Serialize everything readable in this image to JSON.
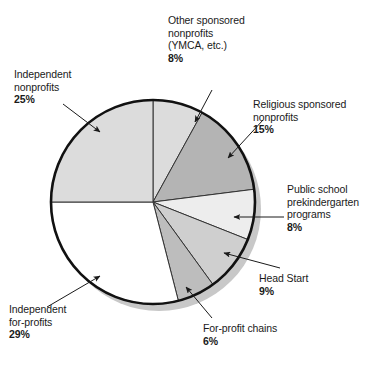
{
  "chart_data": {
    "type": "pie",
    "title": "",
    "subtitle": "",
    "xlabel": "",
    "ylabel": "",
    "legend_position": "callout-labels",
    "grid": false,
    "units": "percent",
    "start_angle_deg": 0,
    "direction": "clockwise",
    "center": {
      "x": 153,
      "y": 202
    },
    "radius": 102,
    "categories": [
      "Other sponsored nonprofits (YMCA, etc.)",
      "Religious sponsored nonprofits",
      "Public school prekindergarten programs",
      "Head Start",
      "For-profit chains",
      "Independent for-profits",
      "Independent nonprofits"
    ],
    "values": [
      8,
      15,
      8,
      9,
      6,
      29,
      25
    ],
    "slices": [
      {
        "name": "other-sponsored-nonprofits",
        "label_lines": [
          "Other sponsored",
          "nonprofits",
          "(YMCA, etc.)"
        ],
        "value": 8,
        "percent_text": "8%",
        "color": "#dcdcdc",
        "start_deg": 0,
        "end_deg": 28.8
      },
      {
        "name": "religious-sponsored-nonprofits",
        "label_lines": [
          "Religious sponsored",
          "nonprofits"
        ],
        "value": 15,
        "percent_text": "15%",
        "color": "#b4b4b4",
        "start_deg": 28.8,
        "end_deg": 82.8
      },
      {
        "name": "public-school-prekindergarten-programs",
        "label_lines": [
          "Public school",
          "prekindergarten",
          "programs"
        ],
        "value": 8,
        "percent_text": "8%",
        "color": "#ededed",
        "start_deg": 82.8,
        "end_deg": 111.6
      },
      {
        "name": "head-start",
        "label_lines": [
          "Head Start"
        ],
        "value": 9,
        "percent_text": "9%",
        "color": "#cfcfcf",
        "start_deg": 111.6,
        "end_deg": 144.0
      },
      {
        "name": "for-profit-chains",
        "label_lines": [
          "For-profit chains"
        ],
        "value": 6,
        "percent_text": "6%",
        "color": "#bdbdbd",
        "start_deg": 144.0,
        "end_deg": 165.6
      },
      {
        "name": "independent-for-profits",
        "label_lines": [
          "Independent",
          "for-profits"
        ],
        "value": 29,
        "percent_text": "29%",
        "color": "#ffffff",
        "start_deg": 165.6,
        "end_deg": 270.0
      },
      {
        "name": "independent-nonprofits",
        "label_lines": [
          "Independent",
          "nonprofits"
        ],
        "value": 25,
        "percent_text": "25%",
        "color": "#dcdcdc",
        "start_deg": 270.0,
        "end_deg": 360.0
      }
    ]
  },
  "labels": {
    "other_sponsored": {
      "line1": "Other sponsored",
      "line2": "nonprofits",
      "line3": "(YMCA, etc.)",
      "percent": "8%"
    },
    "independent_nonprofits": {
      "line1": "Independent",
      "line2": "nonprofits",
      "percent": "25%"
    },
    "religious": {
      "line1": "Religious sponsored",
      "line2": "nonprofits",
      "percent": "15%"
    },
    "public_school": {
      "line1": "Public school",
      "line2": "prekindergarten",
      "line3": "programs",
      "percent": "8%"
    },
    "head_start": {
      "line1": "Head Start",
      "percent": "9%"
    },
    "for_profit_chains": {
      "line1": "For-profit chains",
      "percent": "6%"
    },
    "independent_for_profits": {
      "line1": "Independent",
      "line2": "for-profits",
      "percent": "29%"
    }
  },
  "style": {
    "outline_color": "#111111",
    "divider_color": "#333333",
    "shadow_color": "#c8c8c8",
    "background": "#ffffff",
    "leader_color": "#1a1a1a"
  }
}
